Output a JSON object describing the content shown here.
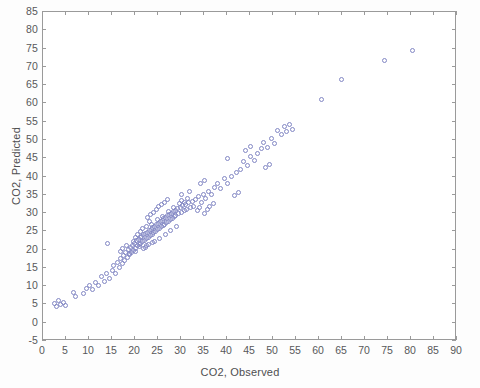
{
  "chart_data": {
    "type": "scatter",
    "title": "",
    "xlabel": "CO2, Observed",
    "ylabel": "CO2, Predicted",
    "xlim": [
      0,
      90
    ],
    "ylim": [
      -5,
      85
    ],
    "xticks": [
      0,
      5,
      10,
      15,
      20,
      25,
      30,
      35,
      40,
      45,
      50,
      55,
      60,
      65,
      70,
      75,
      80,
      85,
      90
    ],
    "yticks": [
      -5,
      0,
      5,
      10,
      15,
      20,
      25,
      30,
      35,
      40,
      45,
      50,
      55,
      60,
      65,
      70,
      75,
      80,
      85
    ],
    "grid": false,
    "legend": null,
    "marker": {
      "shape": "open-circle",
      "color": "#8287c4",
      "size_px": 5,
      "filled": false
    },
    "series": [
      {
        "name": "CO2 Predicted vs Observed",
        "points": [
          [
            2.6,
            5.2
          ],
          [
            3.0,
            4.4
          ],
          [
            3.4,
            6.0
          ],
          [
            3.9,
            5.0
          ],
          [
            4.4,
            5.6
          ],
          [
            4.8,
            4.6
          ],
          [
            6.6,
            8.2
          ],
          [
            7.1,
            7.3
          ],
          [
            8.8,
            8.0
          ],
          [
            9.5,
            9.4
          ],
          [
            10.2,
            10.2
          ],
          [
            10.8,
            9.0
          ],
          [
            11.4,
            11.0
          ],
          [
            12.0,
            10.2
          ],
          [
            12.8,
            12.6
          ],
          [
            13.3,
            11.4
          ],
          [
            13.9,
            13.4
          ],
          [
            14.4,
            12.2
          ],
          [
            14.0,
            21.6
          ],
          [
            15.0,
            14.4
          ],
          [
            15.4,
            15.6
          ],
          [
            15.8,
            13.6
          ],
          [
            16.2,
            16.6
          ],
          [
            16.6,
            15.2
          ],
          [
            16.9,
            17.6
          ],
          [
            17.2,
            16.2
          ],
          [
            17.5,
            18.4
          ],
          [
            17.8,
            17.0
          ],
          [
            18.0,
            19.2
          ],
          [
            18.3,
            17.8
          ],
          [
            18.6,
            20.0
          ],
          [
            18.8,
            18.6
          ],
          [
            19.0,
            20.6
          ],
          [
            19.3,
            19.2
          ],
          [
            19.5,
            21.2
          ],
          [
            19.7,
            19.8
          ],
          [
            19.9,
            21.8
          ],
          [
            20.1,
            20.4
          ],
          [
            20.3,
            22.4
          ],
          [
            20.5,
            21.0
          ],
          [
            20.7,
            22.8
          ],
          [
            20.9,
            21.4
          ],
          [
            21.1,
            23.2
          ],
          [
            21.3,
            21.8
          ],
          [
            21.5,
            23.6
          ],
          [
            21.7,
            22.2
          ],
          [
            21.9,
            24.0
          ],
          [
            22.1,
            22.6
          ],
          [
            22.3,
            24.4
          ],
          [
            22.5,
            23.0
          ],
          [
            22.7,
            24.8
          ],
          [
            22.9,
            23.4
          ],
          [
            23.1,
            25.2
          ],
          [
            23.3,
            23.8
          ],
          [
            23.5,
            25.6
          ],
          [
            23.7,
            24.2
          ],
          [
            23.9,
            26.0
          ],
          [
            24.1,
            24.6
          ],
          [
            24.3,
            26.4
          ],
          [
            24.5,
            25.0
          ],
          [
            24.7,
            26.8
          ],
          [
            24.9,
            25.4
          ],
          [
            25.1,
            27.2
          ],
          [
            25.3,
            25.8
          ],
          [
            25.5,
            27.6
          ],
          [
            25.7,
            26.2
          ],
          [
            25.9,
            28.0
          ],
          [
            26.1,
            26.6
          ],
          [
            26.3,
            28.4
          ],
          [
            26.5,
            27.0
          ],
          [
            26.7,
            28.8
          ],
          [
            26.9,
            27.4
          ],
          [
            27.1,
            29.2
          ],
          [
            27.3,
            27.8
          ],
          [
            27.5,
            29.6
          ],
          [
            27.7,
            28.2
          ],
          [
            27.9,
            30.0
          ],
          [
            28.1,
            28.6
          ],
          [
            28.3,
            30.4
          ],
          [
            28.5,
            29.0
          ],
          [
            28.7,
            30.8
          ],
          [
            28.9,
            29.4
          ],
          [
            29.2,
            31.2
          ],
          [
            29.5,
            29.8
          ],
          [
            29.8,
            31.6
          ],
          [
            30.1,
            30.2
          ],
          [
            30.4,
            32.0
          ],
          [
            30.7,
            30.6
          ],
          [
            31.0,
            32.4
          ],
          [
            31.3,
            31.0
          ],
          [
            31.6,
            32.8
          ],
          [
            32.0,
            31.4
          ],
          [
            32.4,
            33.2
          ],
          [
            32.8,
            31.8
          ],
          [
            16.8,
            19.4
          ],
          [
            17.3,
            20.2
          ],
          [
            18.1,
            21.0
          ],
          [
            18.9,
            19.0
          ],
          [
            19.6,
            22.2
          ],
          [
            20.2,
            19.6
          ],
          [
            21.0,
            20.8
          ],
          [
            21.8,
            20.2
          ],
          [
            22.4,
            26.2
          ],
          [
            23.0,
            21.4
          ],
          [
            23.6,
            27.0
          ],
          [
            24.2,
            22.2
          ],
          [
            24.8,
            28.2
          ],
          [
            25.4,
            23.0
          ],
          [
            26.0,
            29.0
          ],
          [
            26.6,
            24.0
          ],
          [
            27.2,
            30.4
          ],
          [
            27.8,
            25.2
          ],
          [
            28.4,
            31.6
          ],
          [
            29.0,
            26.4
          ],
          [
            22.8,
            28.8
          ],
          [
            23.4,
            29.6
          ],
          [
            24.0,
            30.2
          ],
          [
            24.6,
            31.0
          ],
          [
            25.2,
            31.8
          ],
          [
            25.8,
            32.4
          ],
          [
            26.4,
            33.0
          ],
          [
            27.0,
            33.6
          ],
          [
            20.0,
            23.4
          ],
          [
            20.6,
            24.2
          ],
          [
            21.2,
            25.0
          ],
          [
            21.6,
            25.8
          ],
          [
            22.2,
            20.6
          ],
          [
            22.6,
            21.2
          ],
          [
            23.2,
            27.6
          ],
          [
            23.8,
            22.0
          ],
          [
            29.6,
            32.6
          ],
          [
            30.2,
            33.4
          ],
          [
            30.8,
            33.0
          ],
          [
            31.4,
            34.0
          ],
          [
            33.2,
            33.6
          ],
          [
            33.8,
            34.4
          ],
          [
            34.4,
            33.0
          ],
          [
            34.8,
            35.2
          ],
          [
            35.4,
            34.0
          ],
          [
            36.0,
            36.0
          ],
          [
            36.6,
            35.0
          ],
          [
            37.2,
            37.0
          ],
          [
            33.5,
            30.6
          ],
          [
            34.0,
            31.4
          ],
          [
            35.0,
            30.0
          ],
          [
            35.8,
            31.0
          ],
          [
            38.0,
            38.0
          ],
          [
            38.6,
            36.6
          ],
          [
            39.4,
            39.4
          ],
          [
            40.2,
            38.0
          ],
          [
            40.0,
            45.0
          ],
          [
            41.0,
            40.0
          ],
          [
            42.0,
            41.2
          ],
          [
            43.0,
            42.0
          ],
          [
            43.6,
            44.0
          ],
          [
            44.4,
            43.0
          ],
          [
            45.2,
            45.6
          ],
          [
            46.0,
            44.4
          ],
          [
            44.0,
            47.0
          ],
          [
            45.0,
            48.2
          ],
          [
            46.6,
            46.4
          ],
          [
            47.4,
            47.6
          ],
          [
            48.0,
            49.2
          ],
          [
            48.8,
            48.0
          ],
          [
            49.6,
            50.4
          ],
          [
            50.4,
            49.0
          ],
          [
            51.0,
            52.6
          ],
          [
            51.8,
            51.4
          ],
          [
            52.4,
            53.6
          ],
          [
            53.0,
            52.2
          ],
          [
            53.6,
            54.2
          ],
          [
            54.2,
            52.8
          ],
          [
            48.4,
            42.6
          ],
          [
            49.2,
            43.4
          ],
          [
            41.6,
            34.8
          ],
          [
            42.4,
            35.6
          ],
          [
            36.2,
            31.8
          ],
          [
            37.0,
            32.6
          ],
          [
            30.0,
            35.0
          ],
          [
            31.8,
            36.0
          ],
          [
            34.2,
            38.0
          ],
          [
            35.2,
            39.0
          ],
          [
            60.6,
            61.0
          ],
          [
            64.8,
            66.6
          ],
          [
            74.2,
            71.8
          ],
          [
            80.4,
            74.6
          ]
        ]
      }
    ]
  }
}
